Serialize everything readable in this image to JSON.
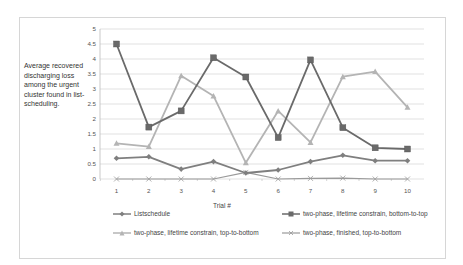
{
  "chart_data": {
    "type": "line",
    "title": "",
    "ylabel": "Average recovered discharging loss among the urgent cluster found in list-scheduling.",
    "xlabel": "Trial #",
    "x": [
      1,
      2,
      3,
      4,
      5,
      6,
      7,
      8,
      9,
      10
    ],
    "ylim": [
      0,
      5
    ],
    "yticks": [
      "0",
      "0.5",
      "1",
      "1.5",
      "2",
      "2.5",
      "3",
      "3.5",
      "4",
      "4.5",
      "5"
    ],
    "grid": true,
    "legend_position": "bottom",
    "series": [
      {
        "name": "Listschedule",
        "marker": "diamond",
        "color": "#7f7f7f",
        "values": [
          0.69,
          0.74,
          0.33,
          0.58,
          0.2,
          0.3,
          0.58,
          0.79,
          0.61,
          0.61
        ]
      },
      {
        "name": "two-phase, lifetime constrain, bottom-to-top",
        "marker": "square",
        "color": "#6a6a6a",
        "values": [
          4.5,
          1.73,
          2.27,
          4.04,
          3.4,
          1.38,
          3.97,
          1.71,
          1.04,
          1.0
        ]
      },
      {
        "name": "two-phase, lifetime constrain, top-to-bottom",
        "marker": "triangle",
        "color": "#b4b4b4",
        "values": [
          1.19,
          1.08,
          3.44,
          2.77,
          0.54,
          2.27,
          1.22,
          3.41,
          3.58,
          2.39
        ]
      },
      {
        "name": "two-phase, finished, top-to-bottom",
        "marker": "x",
        "color": "#9a9a9a",
        "values": [
          0,
          0,
          0,
          0,
          0.22,
          0,
          0.02,
          0.03,
          0,
          0
        ]
      }
    ]
  },
  "labels": {
    "ylabel": "Average recovered discharging loss among the urgent cluster found in list-scheduling.",
    "xtitle": "Trial #",
    "legend": [
      "Listschedule",
      "two-phase, lifetime constrain, bottom-to-top",
      "two-phase, lifetime constrain, top-to-bottom",
      "two-phase, finished, top-to-bottom"
    ]
  }
}
